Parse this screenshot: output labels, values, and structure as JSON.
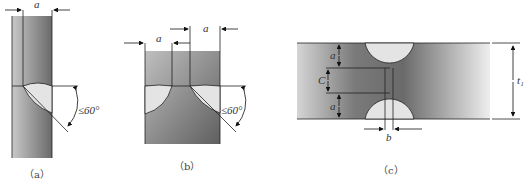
{
  "figures": [
    {
      "id": "a",
      "caption": "（a）",
      "labels": {
        "dim": "a",
        "angle": "≤60°"
      }
    },
    {
      "id": "b",
      "caption": "（b）",
      "labels": {
        "dim_left": "a",
        "dim_right": "a",
        "angle": "≤60°"
      }
    },
    {
      "id": "c",
      "caption": "（c）",
      "labels": {
        "top": "a",
        "middle": "C",
        "bottom": "a",
        "gap": "b",
        "thickness": "t₁"
      }
    }
  ],
  "colors": {
    "steel_dark": "#6f6f6f",
    "steel_light": "#bdbdbd",
    "weld": "#e4e4e4",
    "line": "#222222"
  }
}
